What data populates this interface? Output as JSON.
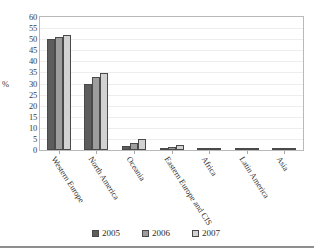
{
  "chart_data": {
    "type": "bar",
    "title": "",
    "subtitle": "",
    "xlabel": "",
    "ylabel": "%",
    "ylim": [
      0,
      60
    ],
    "ytick_step": 5,
    "yticks": [
      "60",
      "55",
      "50",
      "45",
      "40",
      "35",
      "30",
      "25",
      "20",
      "15",
      "10",
      "5",
      "0"
    ],
    "grid": true,
    "legend_position": "bottom",
    "categories": [
      "Western Europe",
      "North America",
      "Oceania",
      "Eastern Europe and CIS",
      "Africa",
      "Latin America",
      "Asia"
    ],
    "series": [
      {
        "name": "2005",
        "color": "#5d5d5d",
        "values": [
          50.2,
          29.8,
          1.9,
          0.9,
          0.7,
          0.8,
          0.3
        ]
      },
      {
        "name": "2006",
        "color": "#9d9d9d",
        "values": [
          50.8,
          33.0,
          3.3,
          1.5,
          0.7,
          1.1,
          0.3
        ]
      },
      {
        "name": "2007",
        "color": "#d2d2d2",
        "values": [
          51.8,
          34.6,
          5.0,
          2.1,
          0.7,
          1.1,
          0.3
        ]
      }
    ]
  },
  "legend": {
    "items": [
      {
        "label": "2005",
        "swatch": "#5d5d5d"
      },
      {
        "label": "2006",
        "swatch": "#9d9d9d"
      },
      {
        "label": "2007",
        "swatch": "#d2d2d2"
      }
    ]
  },
  "axis": {
    "y_title": "%"
  }
}
